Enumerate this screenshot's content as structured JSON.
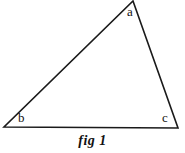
{
  "figure": {
    "caption": "fig 1",
    "background_color": "#ffffff",
    "stroke_color": "#1a1a1a",
    "text_color": "#111111",
    "width": 185,
    "height": 153
  },
  "shape": {
    "type": "triangle",
    "vertices": [
      {
        "id": "a",
        "label": "a",
        "x": 133,
        "y": 1
      },
      {
        "id": "b",
        "label": "b",
        "x": 4,
        "y": 127
      },
      {
        "id": "c",
        "label": "c",
        "x": 178,
        "y": 128
      }
    ],
    "edges": [
      {
        "from": "b",
        "to": "a"
      },
      {
        "from": "a",
        "to": "c"
      },
      {
        "from": "b",
        "to": "c"
      }
    ],
    "points_attr": "133,1 178,128 4,127",
    "stroke_width": 1.6
  },
  "labels": {
    "a": "a",
    "b": "b",
    "c": "c"
  }
}
